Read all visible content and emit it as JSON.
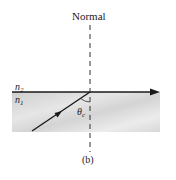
{
  "figure": {
    "caption": "(b)",
    "normal_label": "Normal",
    "upper_medium": {
      "label_base": "n",
      "label_sub": "2",
      "fill": "#ffffff"
    },
    "lower_medium": {
      "label_base": "n",
      "label_sub": "1",
      "fill": "#d9d9d9"
    },
    "angle": {
      "symbol": "θ",
      "sub": "c",
      "meaning": "critical angle"
    },
    "rays": {
      "incident": "incident ray in medium n1 travelling toward interface",
      "refracted": "refracted ray travelling along the interface"
    },
    "colors": {
      "ray": "#1a1a1a",
      "normal_line": "#333333",
      "medium_fill": "#d9d9d9"
    }
  }
}
